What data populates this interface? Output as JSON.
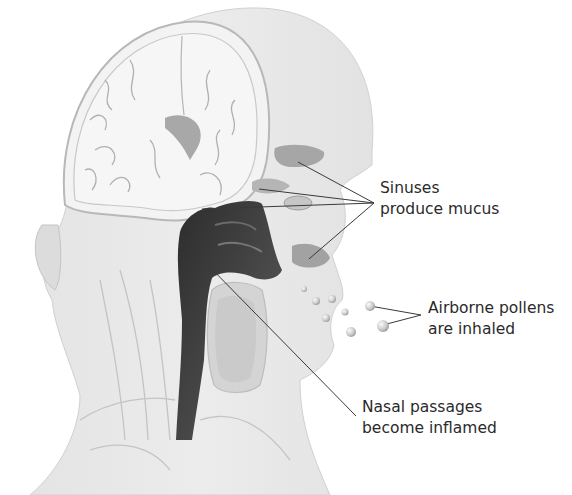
{
  "diagram": {
    "colors": {
      "background": "#ffffff",
      "skin": "#e6e6e6",
      "skin_light": "#efefef",
      "skull_outline": "#b9b9b9",
      "brain": "#f4f4f4",
      "brain_folds": "#a9a9a9",
      "sinus": "#a3a3a3",
      "nasal_passage": "#3d3d3d",
      "mouth_cavity": "#cfcfcf",
      "pollen": "#cfcfcf",
      "leader_line": "#3a3a3a",
      "text": "#2a2a2a"
    },
    "labels": [
      {
        "id": "sinuses",
        "line1": "Sinuses",
        "line2": "produce mucus",
        "x": 380,
        "y": 178,
        "anchor": [
          374,
          203
        ],
        "targets": [
          [
            298,
            162
          ],
          [
            259,
            189
          ],
          [
            202,
            209
          ],
          [
            309,
            259
          ]
        ]
      },
      {
        "id": "pollens",
        "line1": "Airborne pollens",
        "line2": "are inhaled",
        "x": 428,
        "y": 298,
        "anchor": [
          421,
          315
        ],
        "targets": [
          [
            370,
            306
          ],
          [
            383,
            325
          ]
        ]
      },
      {
        "id": "nasal",
        "line1": "Nasal passages",
        "line2": "become inflamed",
        "x": 362,
        "y": 397,
        "anchor": [
          356,
          416
        ],
        "targets": [
          [
            202,
            259
          ]
        ]
      }
    ],
    "pollen_grains": [
      {
        "x": 304,
        "y": 289,
        "r": 3
      },
      {
        "x": 316,
        "y": 301,
        "r": 4
      },
      {
        "x": 332,
        "y": 299,
        "r": 4
      },
      {
        "x": 326,
        "y": 318,
        "r": 4
      },
      {
        "x": 345,
        "y": 312,
        "r": 3.5
      },
      {
        "x": 351,
        "y": 332,
        "r": 5
      },
      {
        "x": 370,
        "y": 306,
        "r": 5
      },
      {
        "x": 383,
        "y": 326,
        "r": 6
      }
    ]
  }
}
